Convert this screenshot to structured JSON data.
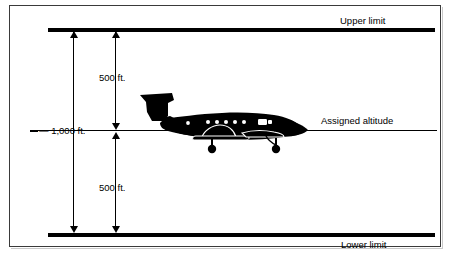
{
  "figure": {
    "title_text_present": false,
    "background_color": "#ffffff",
    "line_color": "#000000",
    "border_color": "#3a3a3a"
  },
  "labels": {
    "upper_limit": "Upper limit",
    "lower_limit": "Lower limit",
    "assigned_altitude": "Assigned altitude",
    "total_span": "— 1,000 ft.",
    "upper_half": "500 ft.",
    "lower_half": "500 ft."
  },
  "diagram_data": {
    "type": "altitude-tolerance-band",
    "assigned_altitude_label": "Assigned altitude",
    "upper_boundary_label": "Upper limit",
    "lower_boundary_label": "Lower limit",
    "tolerance_above_ft": 500,
    "tolerance_below_ft": 500,
    "total_band_ft": 1000,
    "aircraft": "twin-turboprop-silhouette-right-facing"
  },
  "icons": {
    "aircraft": "aircraft-silhouette-icon",
    "arrow_up": "arrow-up-icon",
    "arrow_down": "arrow-down-icon"
  }
}
